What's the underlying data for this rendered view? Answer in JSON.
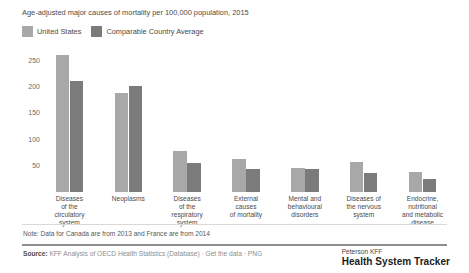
{
  "chart_data": {
    "type": "bar",
    "title": "Age-adjusted major causes of mortality per 100,000 population, 2015",
    "xlabel": "",
    "ylabel": "",
    "ylim": [
      0,
      275
    ],
    "grid": false,
    "legend_position": "top-left",
    "yticks": [
      50,
      100,
      150,
      200,
      250
    ],
    "categories": [
      "Diseases of the circulatory system",
      "Neoplasms",
      "Diseases of the respiratory system",
      "External causes of mortality",
      "Mental and behavioural disorders",
      "Diseases of the nervous system",
      "Endocrine, nutritional and metabolic disease"
    ],
    "category_lines": [
      [
        "Diseases",
        "of the",
        "circulatory",
        "system"
      ],
      [
        "Neoplasms"
      ],
      [
        "Diseases",
        "of the",
        "respiratory",
        "system"
      ],
      [
        "External",
        "causes",
        "of mortality"
      ],
      [
        "Mental and",
        "behavioural",
        "disorders"
      ],
      [
        "Diseases of",
        "the nervous",
        "system"
      ],
      [
        "Endocrine,",
        "nutritional",
        "and metabolic",
        "disease"
      ]
    ],
    "series": [
      {
        "name": "United States",
        "color": "#a8a8a8",
        "values": [
          262,
          190,
          78,
          63,
          45,
          57,
          38
        ]
      },
      {
        "name": "Comparable Country Average",
        "color": "#7b7b7b",
        "values": [
          212,
          203,
          56,
          43,
          43,
          37,
          25
        ]
      }
    ]
  },
  "notes": {
    "note_text": "Note: Data for Canada are from 2013 and France are from 2014"
  },
  "source": {
    "label": "Source:",
    "text": "KFF Analysis of OECD Health Statistics (Database)",
    "separator1": "·",
    "link1": "Get the data",
    "separator2": "·",
    "link2": "PNG"
  },
  "brand": {
    "top": "Peterson KFF",
    "main": "Health System Tracker"
  }
}
